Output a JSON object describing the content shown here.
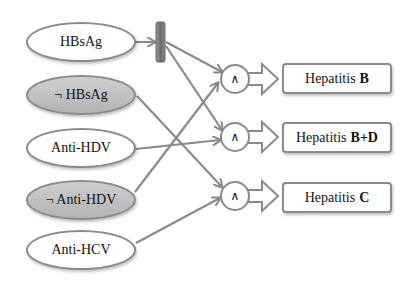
{
  "inputs": [
    {
      "id": "hbsag",
      "label": "HBsAg",
      "negated": false
    },
    {
      "id": "not-hbsag",
      "label": "¬ HBsAg",
      "negated": true
    },
    {
      "id": "anti-hdv",
      "label": "Anti-HDV",
      "negated": false
    },
    {
      "id": "not-anti-hdv",
      "label": "¬ Anti-HDV",
      "negated": true
    },
    {
      "id": "anti-hcv",
      "label": "Anti-HCV",
      "negated": false
    }
  ],
  "gates": [
    {
      "id": "and-1",
      "symbol": "∧"
    },
    {
      "id": "and-2",
      "symbol": "∧"
    },
    {
      "id": "and-3",
      "symbol": "∧"
    }
  ],
  "outputs": [
    {
      "prefix": "Hepatitis",
      "bold": "B"
    },
    {
      "prefix": "Hepatitis",
      "bold": "B+D"
    },
    {
      "prefix": "Hepatitis",
      "bold": "C"
    }
  ],
  "edges": [
    [
      "HBsAg",
      "splitter"
    ],
    [
      "splitter",
      "and-1"
    ],
    [
      "splitter",
      "and-2"
    ],
    [
      "¬ HBsAg",
      "and-3"
    ],
    [
      "Anti-HDV",
      "and-2"
    ],
    [
      "¬ Anti-HDV",
      "and-1"
    ],
    [
      "Anti-HCV",
      "and-3"
    ],
    [
      "and-1",
      "Hepatitis B"
    ],
    [
      "and-2",
      "Hepatitis B+D"
    ],
    [
      "and-3",
      "Hepatitis C"
    ]
  ],
  "colors": {
    "stroke": "#8a8a8a",
    "negated_fill": "#c0c0c0",
    "splitter": "#7a7a7a"
  }
}
